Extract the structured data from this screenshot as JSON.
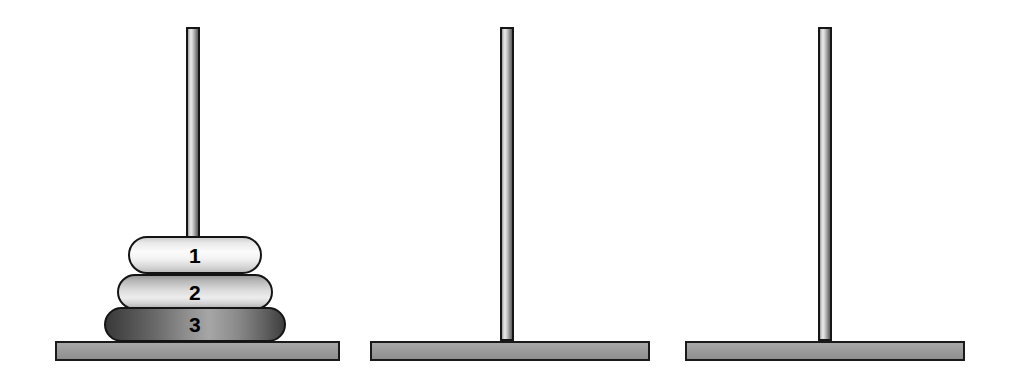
{
  "scene": {
    "title": "Tower of Hanoi",
    "width": 1014,
    "height": 374,
    "background_color": "#ffffff",
    "outline_color": "#161616",
    "peg_count": 3,
    "disk_count": 3
  },
  "pegs": [
    {
      "name": "peg-a",
      "label": "",
      "center_x": 193,
      "peg_top_y": 27,
      "peg_bottom_y": 341,
      "peg_width": 14,
      "base": {
        "x": 55,
        "y": 341,
        "width": 285,
        "height": 20,
        "color": "#9c9c9c"
      },
      "disks": [
        {
          "number": "1",
          "size_rank": 1,
          "x": 128,
          "y": 236,
          "width": 134,
          "height": 38,
          "color": "#f2f2f2",
          "shade": "lightest"
        },
        {
          "number": "2",
          "size_rank": 2,
          "x": 117,
          "y": 274,
          "width": 156,
          "height": 36,
          "color": "#d2d2d2",
          "shade": "light"
        },
        {
          "number": "3",
          "size_rank": 3,
          "x": 104,
          "y": 307,
          "width": 182,
          "height": 35,
          "color": "#6e6e6e",
          "shade": "dark"
        }
      ]
    },
    {
      "name": "peg-b",
      "label": "",
      "center_x": 507,
      "peg_top_y": 27,
      "peg_bottom_y": 341,
      "peg_width": 14,
      "base": {
        "x": 370,
        "y": 341,
        "width": 280,
        "height": 20,
        "color": "#9c9c9c"
      },
      "disks": []
    },
    {
      "name": "peg-c",
      "label": "",
      "center_x": 825,
      "peg_top_y": 27,
      "peg_bottom_y": 341,
      "peg_width": 14,
      "base": {
        "x": 685,
        "y": 341,
        "width": 280,
        "height": 20,
        "color": "#9c9c9c"
      },
      "disks": []
    }
  ]
}
